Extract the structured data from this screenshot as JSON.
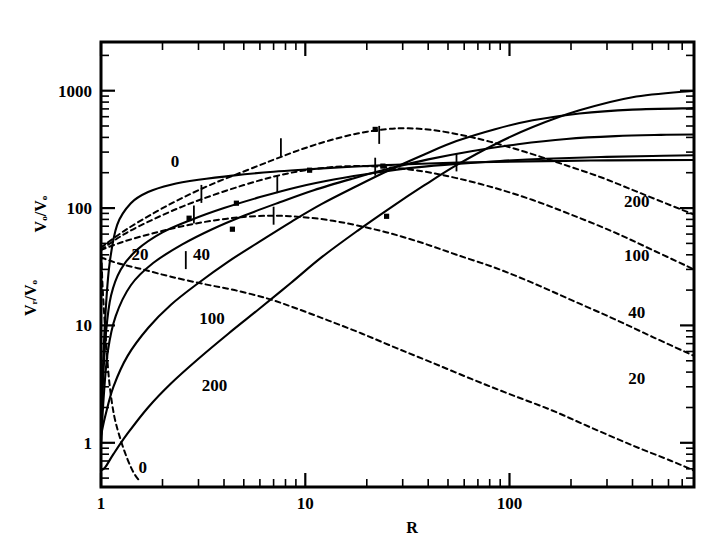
{
  "chart_data": {
    "type": "line",
    "title": "",
    "xlabel": "R",
    "ylabel_primary": "Vₒ/Vₒ",
    "ylabel_secondary": "Vᵣ/Vₒ",
    "xscale": "log",
    "yscale": "log",
    "xlim": [
      1,
      800
    ],
    "ylim": [
      0.42,
      2600
    ],
    "xticks_major": [
      1,
      10,
      100
    ],
    "xtick_labels": [
      "1",
      "10",
      "100"
    ],
    "yticks_major": [
      1,
      10,
      100,
      1000
    ],
    "ytick_labels": [
      "1",
      "10",
      "100",
      "1000"
    ],
    "grid": false,
    "legend": "inline-curve-labels",
    "series": [
      {
        "name": "0",
        "label": "0",
        "style": "solid",
        "quantity": "V_theta/V_o",
        "label_x": 2.3,
        "label_y": 250,
        "points": [
          [
            1.0,
            1.6
          ],
          [
            1.02,
            4.0
          ],
          [
            1.05,
            12
          ],
          [
            1.1,
            33
          ],
          [
            1.2,
            72
          ],
          [
            1.4,
            110
          ],
          [
            1.7,
            137
          ],
          [
            2.2,
            158
          ],
          [
            3.0,
            174
          ],
          [
            4.5,
            190
          ],
          [
            7.0,
            204
          ],
          [
            10,
            213
          ],
          [
            16,
            224
          ],
          [
            25,
            232
          ],
          [
            40,
            240
          ],
          [
            70,
            246
          ],
          [
            120,
            250
          ],
          [
            250,
            254
          ],
          [
            500,
            256
          ],
          [
            800,
            257
          ]
        ]
      },
      {
        "name": "20",
        "label": "20",
        "style": "solid",
        "quantity": "V_theta/V_o",
        "label_x": 1.55,
        "label_y": 41,
        "points": [
          [
            1.0,
            1.05
          ],
          [
            1.02,
            3.0
          ],
          [
            1.06,
            9.0
          ],
          [
            1.12,
            18
          ],
          [
            1.25,
            30
          ],
          [
            1.5,
            44
          ],
          [
            2.0,
            62
          ],
          [
            2.8,
            80
          ],
          [
            4.0,
            100
          ],
          [
            6.0,
            124
          ],
          [
            9.0,
            150
          ],
          [
            14,
            176
          ],
          [
            22,
            200
          ],
          [
            35,
            222
          ],
          [
            55,
            238
          ],
          [
            90,
            252
          ],
          [
            150,
            263
          ],
          [
            280,
            272
          ],
          [
            500,
            278
          ],
          [
            800,
            282
          ]
        ]
      },
      {
        "name": "40",
        "label": "40",
        "style": "solid",
        "quantity": "V_theta/V_o",
        "label_x": 3.1,
        "label_y": 41,
        "points": [
          [
            1.0,
            0.95
          ],
          [
            1.03,
            2.4
          ],
          [
            1.08,
            6.0
          ],
          [
            1.18,
            12
          ],
          [
            1.4,
            22
          ],
          [
            1.8,
            34
          ],
          [
            2.5,
            49
          ],
          [
            3.5,
            66
          ],
          [
            5.0,
            86
          ],
          [
            7.5,
            112
          ],
          [
            11,
            142
          ],
          [
            17,
            178
          ],
          [
            26,
            218
          ],
          [
            40,
            260
          ],
          [
            65,
            305
          ],
          [
            110,
            350
          ],
          [
            190,
            388
          ],
          [
            330,
            410
          ],
          [
            550,
            420
          ],
          [
            800,
            424
          ]
        ]
      },
      {
        "name": "100",
        "label": "100",
        "style": "solid",
        "quantity": "V_theta/V_o",
        "label_x": 3.5,
        "label_y": 11.5,
        "points": [
          [
            1.0,
            1.15
          ],
          [
            1.05,
            1.7
          ],
          [
            1.15,
            3.0
          ],
          [
            1.35,
            5.5
          ],
          [
            1.7,
            9.5
          ],
          [
            2.2,
            15
          ],
          [
            3.0,
            23
          ],
          [
            4.2,
            35
          ],
          [
            6.0,
            52
          ],
          [
            8.5,
            76
          ],
          [
            12,
            108
          ],
          [
            18,
            155
          ],
          [
            26,
            212
          ],
          [
            38,
            285
          ],
          [
            55,
            372
          ],
          [
            85,
            470
          ],
          [
            130,
            560
          ],
          [
            220,
            640
          ],
          [
            400,
            690
          ],
          [
            800,
            710
          ]
        ]
      },
      {
        "name": "200",
        "label": "200",
        "style": "solid",
        "quantity": "V_theta/V_o",
        "label_x": 3.6,
        "label_y": 3.1,
        "points": [
          [
            1.0,
            0.58
          ],
          [
            1.05,
            0.62
          ],
          [
            1.15,
            0.8
          ],
          [
            1.35,
            1.2
          ],
          [
            1.7,
            2.0
          ],
          [
            2.2,
            3.2
          ],
          [
            3.0,
            5.2
          ],
          [
            4.2,
            8.5
          ],
          [
            6.0,
            14
          ],
          [
            8.5,
            23
          ],
          [
            12,
            38
          ],
          [
            18,
            64
          ],
          [
            26,
            100
          ],
          [
            38,
            155
          ],
          [
            55,
            232
          ],
          [
            85,
            350
          ],
          [
            130,
            490
          ],
          [
            220,
            680
          ],
          [
            400,
            880
          ],
          [
            800,
            1000
          ]
        ]
      },
      {
        "name": "0d",
        "label": "0",
        "style": "dashed",
        "quantity": "V_r/V_o",
        "label_x": 1.6,
        "label_y": 0.62,
        "points": [
          [
            1.0,
            48
          ],
          [
            1.02,
            20
          ],
          [
            1.06,
            7.0
          ],
          [
            1.1,
            3.2
          ],
          [
            1.16,
            1.7
          ],
          [
            1.25,
            1.05
          ],
          [
            1.35,
            0.72
          ],
          [
            1.45,
            0.55
          ],
          [
            1.55,
            0.47
          ]
        ]
      },
      {
        "name": "20d",
        "label": "20",
        "style": "dashed",
        "quantity": "V_r/V_o",
        "label_x": 420,
        "label_y": 3.6,
        "points": [
          [
            1.0,
            38
          ],
          [
            1.2,
            34
          ],
          [
            1.6,
            30
          ],
          [
            2.2,
            26
          ],
          [
            3.2,
            22.5
          ],
          [
            4.5,
            20
          ],
          [
            6.5,
            17
          ],
          [
            9.0,
            14
          ],
          [
            13,
            11
          ],
          [
            19,
            8.5
          ],
          [
            28,
            6.4
          ],
          [
            42,
            4.8
          ],
          [
            65,
            3.5
          ],
          [
            100,
            2.6
          ],
          [
            160,
            1.9
          ],
          [
            250,
            1.35
          ],
          [
            400,
            0.95
          ],
          [
            620,
            0.7
          ],
          [
            800,
            0.58
          ]
        ]
      },
      {
        "name": "40d",
        "label": "40",
        "style": "dashed",
        "quantity": "V_r/V_o",
        "label_x": 420,
        "label_y": 13,
        "points": [
          [
            1.0,
            44
          ],
          [
            1.3,
            52
          ],
          [
            1.8,
            61
          ],
          [
            2.5,
            70
          ],
          [
            3.5,
            78
          ],
          [
            5.0,
            84
          ],
          [
            7.0,
            86
          ],
          [
            9.5,
            84
          ],
          [
            13,
            79
          ],
          [
            18,
            71
          ],
          [
            26,
            61
          ],
          [
            38,
            50
          ],
          [
            55,
            40
          ],
          [
            85,
            31
          ],
          [
            130,
            23
          ],
          [
            200,
            16.5
          ],
          [
            320,
            11.5
          ],
          [
            500,
            8.0
          ],
          [
            800,
            5.5
          ]
        ]
      },
      {
        "name": "100d",
        "label": "100",
        "style": "dashed",
        "quantity": "V_r/V_o",
        "label_x": 420,
        "label_y": 40,
        "points": [
          [
            1.0,
            44
          ],
          [
            1.3,
            60
          ],
          [
            1.8,
            80
          ],
          [
            2.5,
            103
          ],
          [
            3.5,
            128
          ],
          [
            5.0,
            157
          ],
          [
            7.0,
            185
          ],
          [
            9.5,
            207
          ],
          [
            13,
            222
          ],
          [
            18,
            228
          ],
          [
            26,
            222
          ],
          [
            38,
            205
          ],
          [
            55,
            180
          ],
          [
            85,
            148
          ],
          [
            130,
            117
          ],
          [
            200,
            88
          ],
          [
            320,
            63
          ],
          [
            500,
            44
          ],
          [
            800,
            30
          ]
        ]
      },
      {
        "name": "200d",
        "label": "200",
        "style": "dashed",
        "quantity": "V_r/V_o",
        "label_x": 420,
        "label_y": 115,
        "points": [
          [
            1.0,
            46
          ],
          [
            1.3,
            64
          ],
          [
            1.8,
            90
          ],
          [
            2.5,
            122
          ],
          [
            3.5,
            160
          ],
          [
            5.0,
            205
          ],
          [
            7.0,
            258
          ],
          [
            9.5,
            315
          ],
          [
            13,
            375
          ],
          [
            18,
            432
          ],
          [
            25,
            470
          ],
          [
            32,
            478
          ],
          [
            42,
            462
          ],
          [
            58,
            420
          ],
          [
            80,
            368
          ],
          [
            120,
            300
          ],
          [
            180,
            238
          ],
          [
            280,
            183
          ],
          [
            420,
            138
          ],
          [
            620,
            105
          ],
          [
            800,
            88
          ]
        ]
      }
    ],
    "annotations": {
      "curve_tick_markers": [
        {
          "x": 2.85,
          "y": 88
        },
        {
          "x": 3.1,
          "y": 132
        },
        {
          "x": 2.6,
          "y": 36
        },
        {
          "x": 7.0,
          "y": 86
        },
        {
          "x": 7.3,
          "y": 160
        },
        {
          "x": 7.6,
          "y": 330
        },
        {
          "x": 22,
          "y": 225
        },
        {
          "x": 23,
          "y": 420
        },
        {
          "x": 55,
          "y": 245
        }
      ],
      "data_point_markers": [
        {
          "x": 2.7,
          "y": 82
        },
        {
          "x": 4.4,
          "y": 66
        },
        {
          "x": 4.6,
          "y": 110
        },
        {
          "x": 10.5,
          "y": 210
        },
        {
          "x": 22,
          "y": 468
        },
        {
          "x": 24,
          "y": 228
        },
        {
          "x": 25,
          "y": 85
        }
      ]
    }
  },
  "axis": {
    "x_title": "R",
    "y_title_top": "Vₒ/Vₒ",
    "y_title_bottom": "Vᵣ/Vₒ"
  }
}
